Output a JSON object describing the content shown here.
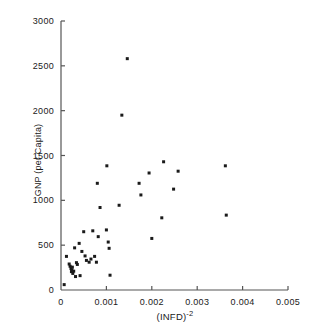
{
  "chart_data": {
    "type": "scatter",
    "title": "",
    "xlabel": "(INFD)-2",
    "xlabel_base": "(INFD)",
    "xlabel_exponent": "-2",
    "ylabel": "GNP (per Capita)",
    "xlim": [
      0,
      0.005
    ],
    "ylim": [
      0,
      3000
    ],
    "grid": false,
    "legend": null,
    "xticks": [
      0,
      0.001,
      0.002,
      0.003,
      0.004,
      0.005
    ],
    "xtick_labels": [
      "0",
      "0.001",
      "0.002",
      "0.003",
      "0.004",
      "0.005"
    ],
    "yticks": [
      0,
      500,
      1000,
      1500,
      2000,
      2500,
      3000
    ],
    "ytick_labels": [
      "0",
      "500",
      "1000",
      "1500",
      "2000",
      "2500",
      "3000"
    ],
    "marker": "square-dot",
    "marker_color": "#1a1a1a",
    "points": [
      {
        "x": 7e-05,
        "y": 60
      },
      {
        "x": 0.00012,
        "y": 375
      },
      {
        "x": 0.00018,
        "y": 290
      },
      {
        "x": 0.0002,
        "y": 265
      },
      {
        "x": 0.00022,
        "y": 240
      },
      {
        "x": 0.00023,
        "y": 205
      },
      {
        "x": 0.00024,
        "y": 225
      },
      {
        "x": 0.00025,
        "y": 255
      },
      {
        "x": 0.00026,
        "y": 185
      },
      {
        "x": 0.00028,
        "y": 210
      },
      {
        "x": 0.0003,
        "y": 470
      },
      {
        "x": 0.00032,
        "y": 150
      },
      {
        "x": 0.00034,
        "y": 305
      },
      {
        "x": 0.00036,
        "y": 285
      },
      {
        "x": 0.0004,
        "y": 520
      },
      {
        "x": 0.00042,
        "y": 160
      },
      {
        "x": 0.00046,
        "y": 430
      },
      {
        "x": 0.0005,
        "y": 650
      },
      {
        "x": 0.00053,
        "y": 380
      },
      {
        "x": 0.00056,
        "y": 330
      },
      {
        "x": 0.00062,
        "y": 310
      },
      {
        "x": 0.00066,
        "y": 345
      },
      {
        "x": 0.0007,
        "y": 660
      },
      {
        "x": 0.00074,
        "y": 375
      },
      {
        "x": 0.00078,
        "y": 310
      },
      {
        "x": 0.0008,
        "y": 1190
      },
      {
        "x": 0.00082,
        "y": 595
      },
      {
        "x": 0.00086,
        "y": 920
      },
      {
        "x": 0.001,
        "y": 670
      },
      {
        "x": 0.00101,
        "y": 1385
      },
      {
        "x": 0.00104,
        "y": 535
      },
      {
        "x": 0.00106,
        "y": 465
      },
      {
        "x": 0.00108,
        "y": 165
      },
      {
        "x": 0.00128,
        "y": 945
      },
      {
        "x": 0.00134,
        "y": 1950
      },
      {
        "x": 0.00146,
        "y": 2580
      },
      {
        "x": 0.00172,
        "y": 1190
      },
      {
        "x": 0.00176,
        "y": 1060
      },
      {
        "x": 0.00194,
        "y": 1305
      },
      {
        "x": 0.002,
        "y": 575
      },
      {
        "x": 0.00222,
        "y": 805
      },
      {
        "x": 0.00226,
        "y": 1430
      },
      {
        "x": 0.00248,
        "y": 1125
      },
      {
        "x": 0.00258,
        "y": 1325
      },
      {
        "x": 0.00362,
        "y": 1385
      },
      {
        "x": 0.00364,
        "y": 835
      }
    ]
  },
  "axes_geometry": {
    "left": 61,
    "right": 288,
    "bottom": 290,
    "top": 21
  }
}
